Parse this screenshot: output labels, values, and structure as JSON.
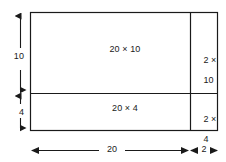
{
  "diagram": {
    "background_color": "#ffffff",
    "line_color": "#1a1a1a",
    "text_color": "#1a1a1a",
    "cells": [
      {
        "id": "top-left",
        "label": "20 × 10",
        "width": "20",
        "height": "10"
      },
      {
        "id": "bottom-left",
        "label": "20 × 4",
        "width": "20",
        "height": "4"
      },
      {
        "id": "top-right",
        "label_line1": "2 ×",
        "label_line2": "10",
        "width": "2",
        "height": "10"
      },
      {
        "id": "bottom-right",
        "label_line1": "2 ×",
        "label_line2": "4",
        "width": "2",
        "height": "4"
      }
    ],
    "dimensions": {
      "left_upper": "10",
      "left_lower": "4",
      "bottom_main": "20",
      "bottom_right": "2"
    }
  }
}
